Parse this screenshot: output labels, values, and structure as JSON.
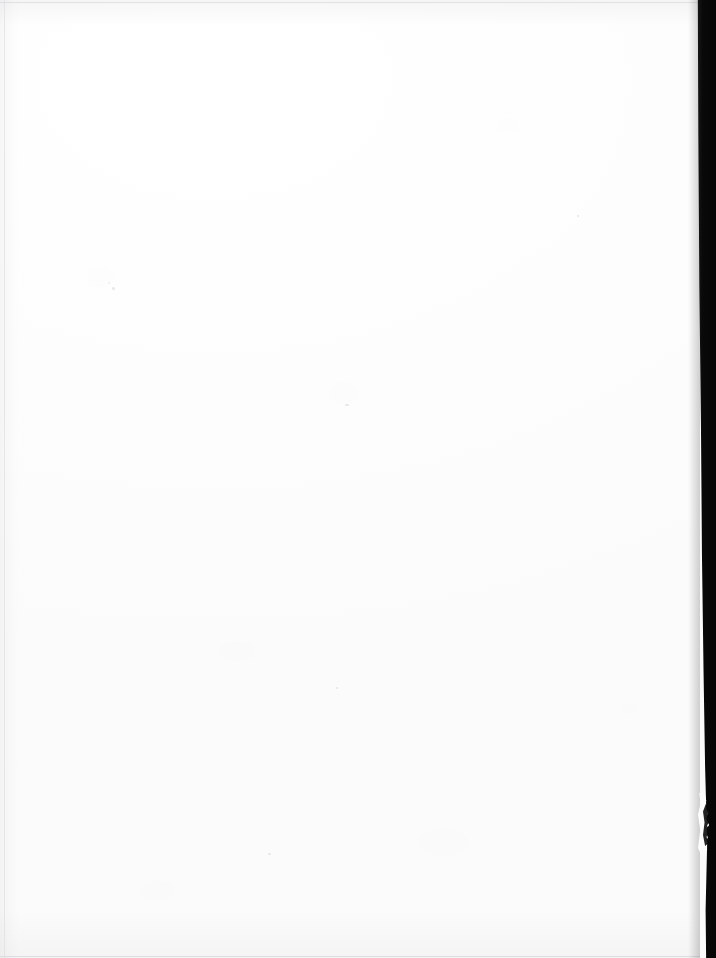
{
  "document": {
    "kind": "scanned-page",
    "content_state": "blank",
    "page_text": "",
    "caption": "Blank scanned page"
  },
  "canvas": {
    "width_px": 716,
    "height_px": 958,
    "paper_color": "#fdfdfe",
    "background_color": "#ffffff"
  },
  "artifacts": {
    "gutter": {
      "label": "scan gutter shadow",
      "color": "#090909",
      "edge_color": "#d9d9dd",
      "side": "right",
      "start_x_px": 698,
      "end_x_px": 716
    },
    "notch": {
      "label": "torn page edge",
      "color": "#fdfdfd",
      "top_px": 793,
      "height_px": 64
    },
    "edges": {
      "line_color": "#d9d9dd",
      "top_y_px": 2,
      "left_x_px": 4,
      "bottom_y_px": 956
    },
    "specks": {
      "label": "scanner dust specks",
      "color": "#78787f",
      "count": 6
    }
  }
}
